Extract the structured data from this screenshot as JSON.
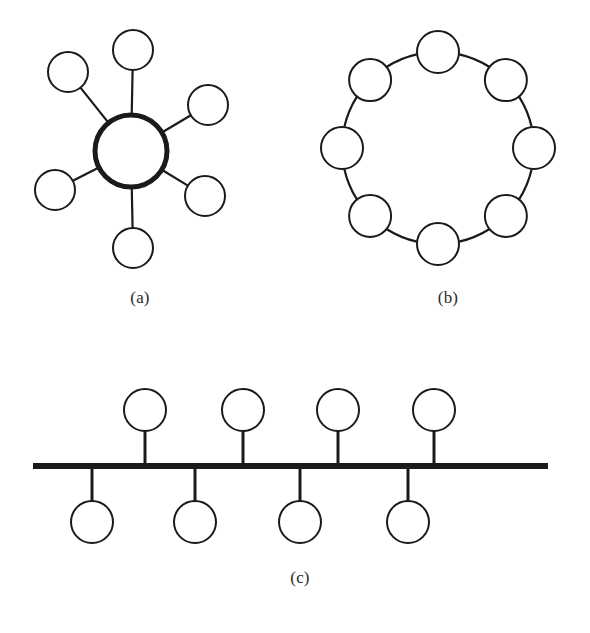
{
  "figure": {
    "background_color": "#ffffff",
    "stroke_color": "#1a1a1a",
    "fill_color": "#ffffff",
    "captions": [
      {
        "id": "a",
        "label": "(a)",
        "topology": "star"
      },
      {
        "id": "b",
        "label": "(b)",
        "topology": "ring"
      },
      {
        "id": "c",
        "label": "(c)",
        "topology": "bus"
      }
    ]
  },
  "chart_data": {
    "type": "diagram",
    "panels": [
      {
        "id": "a",
        "label": "(a)",
        "topology": "star",
        "hub": {
          "cx": 131,
          "cy": 151,
          "r": 36,
          "stroke_width": 5
        },
        "node_radius": 20,
        "node_stroke_width": 2,
        "nodes": [
          {
            "name": "node-top",
            "cx": 133,
            "cy": 50
          },
          {
            "name": "node-upper-left",
            "cx": 68,
            "cy": 72
          },
          {
            "name": "node-upper-right",
            "cx": 208,
            "cy": 105
          },
          {
            "name": "node-lower-left",
            "cx": 55,
            "cy": 190
          },
          {
            "name": "node-lower-right",
            "cx": 205,
            "cy": 196
          },
          {
            "name": "node-bottom",
            "cx": 133,
            "cy": 248
          }
        ],
        "edge_count": 6
      },
      {
        "id": "b",
        "label": "(b)",
        "topology": "ring",
        "ring_center": {
          "cx": 438,
          "cy": 148
        },
        "ring_radius": 96,
        "node_radius": 21,
        "node_stroke_width": 2,
        "node_count": 8,
        "start_angle_deg": -90,
        "edge_count": 8
      },
      {
        "id": "c",
        "label": "(c)",
        "topology": "bus",
        "bus_line": {
          "x1": 33,
          "x2": 548,
          "y": 466,
          "stroke_width": 6
        },
        "node_radius": 21,
        "node_stroke_width": 2,
        "stem_stroke_width": 3,
        "nodes_above": [
          {
            "name": "node-above-1",
            "cx": 145,
            "cy": 410
          },
          {
            "name": "node-above-2",
            "cx": 243,
            "cy": 410
          },
          {
            "name": "node-above-3",
            "cx": 338,
            "cy": 410
          },
          {
            "name": "node-above-4",
            "cx": 434,
            "cy": 410
          }
        ],
        "nodes_below": [
          {
            "name": "node-below-1",
            "cx": 92,
            "cy": 522
          },
          {
            "name": "node-below-2",
            "cx": 195,
            "cy": 522
          },
          {
            "name": "node-below-3",
            "cx": 300,
            "cy": 522
          },
          {
            "name": "node-below-4",
            "cx": 408,
            "cy": 522
          }
        ]
      }
    ]
  }
}
